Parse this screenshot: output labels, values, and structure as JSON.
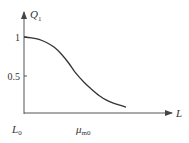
{
  "chart_data": {
    "type": "line",
    "title": "",
    "xlabel": "L",
    "ylabel": "Q",
    "ylabel_subscript": "1",
    "y_ticks": [
      {
        "value": 1,
        "label": "1"
      },
      {
        "value": 0.5,
        "label": "0.5"
      }
    ],
    "x_ticks": [
      {
        "value": 0,
        "label": "L",
        "subscript": "0"
      },
      {
        "value": 0.34,
        "label": "μ",
        "subscript": "m0"
      }
    ],
    "xlim": [
      0,
      1
    ],
    "ylim": [
      0,
      1.25
    ],
    "grid": false,
    "legend": "none",
    "series": [
      {
        "name": "Q1",
        "x": [
          0,
          0.05,
          0.1,
          0.15,
          0.2,
          0.25,
          0.3,
          0.34,
          0.4,
          0.45,
          0.5,
          0.55,
          0.6,
          0.65,
          0.68
        ],
        "y": [
          1.0,
          0.99,
          0.97,
          0.93,
          0.87,
          0.78,
          0.66,
          0.55,
          0.42,
          0.33,
          0.25,
          0.19,
          0.15,
          0.12,
          0.1
        ]
      }
    ]
  }
}
